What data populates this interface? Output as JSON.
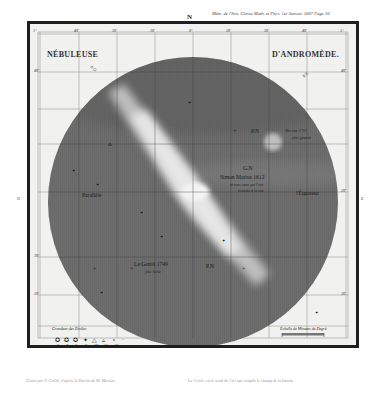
{
  "header": {
    "publication_note": "Mém. de l'Inst. Classe Math. et Phys. 1er Semest. 1807 Page 10.",
    "north_label": "N"
  },
  "plate": {
    "title_left": "NÉBULEUSE",
    "title_right": "D'ANDROMÈDE.",
    "compass": {
      "nw": "N.O.",
      "ne": "N.E.",
      "west": "O",
      "east": "E"
    },
    "labels": {
      "messier": "Messier 1757",
      "messier_note": "plus grande",
      "pn_top": "P.N",
      "gn_letters": "G.N",
      "simon_marius": "Simon Marius 1612",
      "simon_marius_note1": "et tous ceux qui l'ont",
      "simon_marius_note2": "trouvée à la vue",
      "parallele": "Parallèle",
      "equateur": "l'Équateur",
      "le_gentil": "Le Gentil 1749",
      "le_gentil_note": "plus belle",
      "pn_bottom": "P.N"
    },
    "top_ticks": [
      "1°",
      "40'",
      "30'",
      "10'",
      "0°",
      "10'",
      "30'",
      "40'",
      "1°"
    ],
    "bottom_ticks": [
      "1°",
      "40'",
      "30'",
      "10'",
      "0°",
      "10'",
      "30'",
      "40'",
      "1°"
    ],
    "side_ticks_left": [
      "40'",
      "30'",
      "20'"
    ],
    "side_ticks_right": [
      "40'",
      "20'",
      "30'"
    ],
    "legend": {
      "title": "Grandeur des Étoiles",
      "magnitudes": [
        "6",
        "7",
        "8",
        "9",
        "10",
        "11",
        "12"
      ]
    },
    "scale": {
      "title": "Échelle de Minutes de Degré",
      "ticks": [
        "0",
        "5",
        "10",
        "15",
        "20"
      ]
    }
  },
  "footer": {
    "left": "Gravé par F. Collin, d'après le Dessin de M. Messier.",
    "right": "Le Cercle est le fond du Ciel qui remplit le champ de la lunette"
  },
  "colors": {
    "paper": "#ffffff",
    "plate_background": "#f1f1ef",
    "sky_disc": "#6e6e6e",
    "nebula": "#d8d8d8",
    "frame": "#1e1e1e"
  }
}
